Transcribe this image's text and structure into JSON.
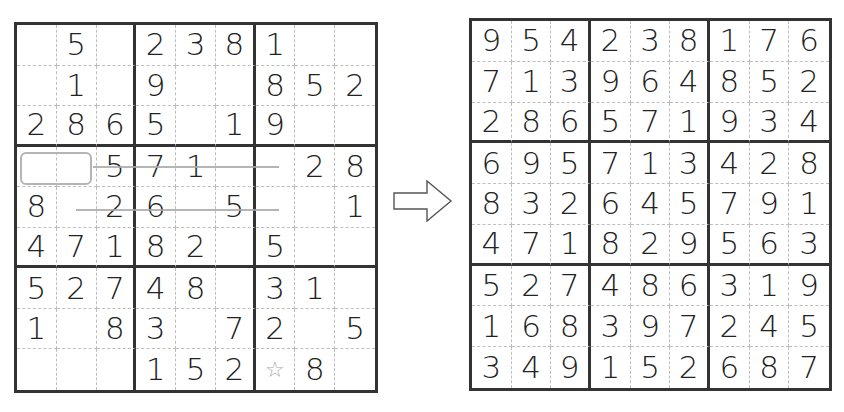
{
  "puzzle": {
    "title": "Sudoku puzzle (given)",
    "rows": [
      [
        "",
        "5",
        "",
        "2",
        "3",
        "8",
        "1",
        "",
        ""
      ],
      [
        "",
        "1",
        "",
        "9",
        "",
        "",
        "8",
        "5",
        "2"
      ],
      [
        "2",
        "8",
        "6",
        "5",
        "",
        "1",
        "9",
        "",
        ""
      ],
      [
        "",
        "",
        "5",
        "7",
        "1",
        "",
        "",
        "2",
        "8"
      ],
      [
        "8",
        "",
        "2",
        "6",
        "",
        "5",
        "",
        "",
        "1"
      ],
      [
        "4",
        "7",
        "1",
        "8",
        "2",
        "",
        "5",
        "",
        ""
      ],
      [
        "5",
        "2",
        "7",
        "4",
        "8",
        "",
        "3",
        "1",
        ""
      ],
      [
        "1",
        "",
        "8",
        "3",
        "",
        "7",
        "2",
        "",
        "5"
      ],
      [
        "",
        "",
        "",
        "1",
        "5",
        "2",
        "★",
        "8",
        ""
      ]
    ],
    "marked_cell": {
      "row": 9,
      "col": 7,
      "icon": "star-outline-icon",
      "glyph": "☆",
      "color": "#aaaaaa"
    },
    "highlight_box": {
      "row": 4,
      "cols": [
        1,
        2
      ]
    },
    "annotation_lines": [
      {
        "row": 4,
        "from_col": 3,
        "to_col": 6
      },
      {
        "row": 5,
        "from_col": 2,
        "to_col": 6
      }
    ]
  },
  "arrow": {
    "icon": "right-arrow-icon",
    "direction": "right"
  },
  "solution": {
    "title": "Sudoku solution",
    "rows": [
      [
        "9",
        "5",
        "4",
        "2",
        "3",
        "8",
        "1",
        "7",
        "6"
      ],
      [
        "7",
        "1",
        "3",
        "9",
        "6",
        "4",
        "8",
        "5",
        "2"
      ],
      [
        "2",
        "8",
        "6",
        "5",
        "7",
        "1",
        "9",
        "3",
        "4"
      ],
      [
        "6",
        "9",
        "5",
        "7",
        "1",
        "3",
        "4",
        "2",
        "8"
      ],
      [
        "8",
        "3",
        "2",
        "6",
        "4",
        "5",
        "7",
        "9",
        "1"
      ],
      [
        "4",
        "7",
        "1",
        "8",
        "2",
        "9",
        "5",
        "6",
        "3"
      ],
      [
        "5",
        "2",
        "7",
        "4",
        "8",
        "6",
        "3",
        "1",
        "9"
      ],
      [
        "1",
        "6",
        "8",
        "3",
        "9",
        "7",
        "2",
        "4",
        "5"
      ],
      [
        "3",
        "4",
        "9",
        "1",
        "5",
        "2",
        "6",
        "8",
        "7"
      ]
    ]
  },
  "colors": {
    "thick_line": "#333333",
    "thin_line": "#bdbdbd",
    "digit": "#222222",
    "annotation": "#a8a8a8",
    "background": "#ffffff"
  }
}
